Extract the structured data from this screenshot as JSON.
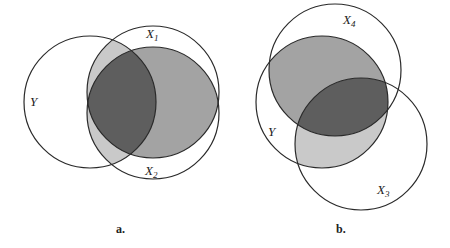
{
  "colors": {
    "light": "#c9c9c9",
    "medium": "#a3a3a3",
    "dark": "#5e5e5e",
    "stroke": "#2a2a2a"
  },
  "diagram_a": {
    "caption": "a.",
    "circles": [
      {
        "name": "Y",
        "cx": 90,
        "cy": 102,
        "r": 66
      },
      {
        "name": "X1",
        "cx": 153,
        "cy": 92,
        "r": 66
      },
      {
        "name": "X2",
        "cx": 153,
        "cy": 113,
        "r": 66
      }
    ],
    "labels": {
      "y": "Y",
      "x1_main": "X",
      "x1_sub": "1",
      "x2_main": "X",
      "x2_sub": "2"
    },
    "shading": {
      "Y∩(X1∪X2) outside X1∩X2": "light",
      "X1∩X2 outside Y": "medium",
      "Y∩X1∩X2": "dark"
    }
  },
  "diagram_b": {
    "caption": "b.",
    "circles": [
      {
        "name": "Y",
        "cx": 322,
        "cy": 102,
        "r": 66
      },
      {
        "name": "X4",
        "cx": 335,
        "cy": 70,
        "r": 66
      },
      {
        "name": "X3",
        "cx": 361,
        "cy": 144,
        "r": 66
      }
    ],
    "labels": {
      "y": "Y",
      "x4_main": "X",
      "x4_sub": "4",
      "x3_main": "X",
      "x3_sub": "3"
    },
    "shading": {
      "Y∩X4 outside X3": "medium",
      "Y∩X3 outside X4": "light",
      "Y∩X3∩X4": "dark"
    }
  }
}
